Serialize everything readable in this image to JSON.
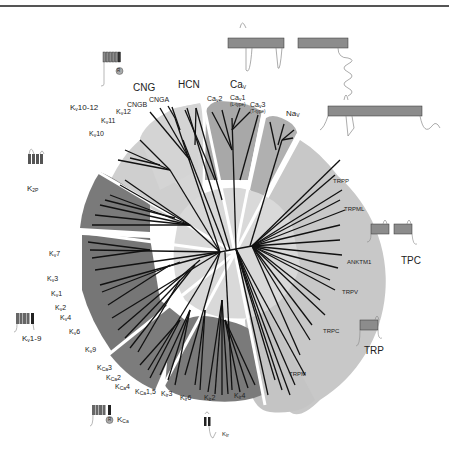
{
  "figure": {
    "colors": {
      "light_sector": "#cfcfcf",
      "mid_sector": "#a8a8a8",
      "dark_sector": "#7a7a7a",
      "center_disc": "#d9d9d9",
      "branch": "#111111",
      "topology_fill": "#8c8c8c"
    }
  },
  "groups": {
    "kv10_12": {
      "main": "K",
      "sub": "v",
      "rest": "10-12"
    },
    "cng": "CNG",
    "hcn": "HCN",
    "cav": {
      "main": "Ca",
      "sub": "V"
    },
    "nav": {
      "main": "Na",
      "sub": "V"
    },
    "k2p": {
      "main": "K",
      "sub": "2P"
    },
    "kv1_9": {
      "main": "K",
      "sub": "v",
      "rest": "1-9"
    },
    "kca": {
      "main": "K",
      "sub": "Ca"
    },
    "kir": {
      "main": "K",
      "sub": "ir"
    },
    "trp": "TRP",
    "tpc": "TPC"
  },
  "leaves": {
    "kv10": {
      "main": "K",
      "sub": "v",
      "rest": "10"
    },
    "kv11": {
      "main": "K",
      "sub": "v",
      "rest": "11"
    },
    "kv12": {
      "main": "K",
      "sub": "v",
      "rest": "12"
    },
    "cngb": "CNGB",
    "cnga": "CNGA",
    "cav2": {
      "main": "Ca",
      "sub": "v",
      "rest": "2"
    },
    "cav1": {
      "main": "Ca",
      "sub": "v",
      "rest": "1",
      "note": "(L-type)"
    },
    "cav3": {
      "main": "Ca",
      "sub": "v",
      "rest": "3",
      "note": "(T-type)"
    },
    "trpp": "TRPP",
    "trpml": "TRPML",
    "anktm1": "ANKTM1",
    "trpv": "TRPV",
    "trpc": "TRPC",
    "trpm": "TRPM",
    "kv7": {
      "main": "K",
      "sub": "v",
      "rest": "7"
    },
    "kv3": {
      "main": "K",
      "sub": "v",
      "rest": "3"
    },
    "kv1": {
      "main": "K",
      "sub": "v",
      "rest": "1"
    },
    "kv2": {
      "main": "K",
      "sub": "v",
      "rest": "2"
    },
    "kv4": {
      "main": "K",
      "sub": "v",
      "rest": "4"
    },
    "kv6": {
      "main": "K",
      "sub": "v",
      "rest": "6"
    },
    "kv9": {
      "main": "K",
      "sub": "v",
      "rest": "9"
    },
    "kca3": {
      "main": "K",
      "sub": "Ca",
      "rest": "3"
    },
    "kca2": {
      "main": "K",
      "sub": "Ca",
      "rest": "2"
    },
    "kca4": {
      "main": "K",
      "sub": "Ca",
      "rest": "4"
    },
    "kca15": {
      "main": "K",
      "sub": "Ca",
      "rest": "1,5"
    },
    "kir3": {
      "main": "K",
      "sub": "ir",
      "rest": "3"
    },
    "kir6": {
      "main": "K",
      "sub": "ir",
      "rest": "6"
    },
    "kir2": {
      "main": "K",
      "sub": "ir",
      "rest": "2"
    },
    "kir4": {
      "main": "K",
      "sub": "ir",
      "rest": "4"
    }
  },
  "icons": {
    "regulatory_domain": "R"
  }
}
